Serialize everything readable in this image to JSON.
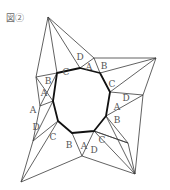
{
  "figure": {
    "label": "図②",
    "colors": {
      "thin_line": "#3a3a3a",
      "thick_line": "#111111",
      "label_text": "#555555"
    }
  },
  "labels": [
    {
      "id": "top-B",
      "text": "B"
    },
    {
      "id": "top-C",
      "text": "C"
    },
    {
      "id": "top-D",
      "text": "D"
    },
    {
      "id": "top-A",
      "text": "A"
    },
    {
      "id": "right-B",
      "text": "B"
    },
    {
      "id": "right-C",
      "text": "C"
    },
    {
      "id": "right-D",
      "text": "D"
    },
    {
      "id": "right-A",
      "text": "A"
    },
    {
      "id": "br-B",
      "text": "B"
    },
    {
      "id": "br-C",
      "text": "C"
    },
    {
      "id": "br-D",
      "text": "D"
    },
    {
      "id": "br-A",
      "text": "A"
    },
    {
      "id": "bl-B",
      "text": "B"
    },
    {
      "id": "bl-C",
      "text": "C"
    },
    {
      "id": "bl-D",
      "text": "D"
    },
    {
      "id": "bl-A",
      "text": "A"
    },
    {
      "id": "left-A",
      "text": "A"
    }
  ]
}
